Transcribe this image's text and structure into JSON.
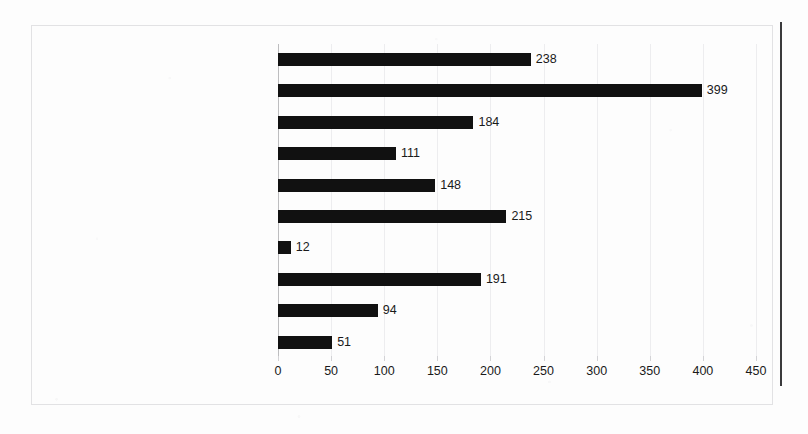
{
  "chart_data": {
    "type": "bar",
    "orientation": "horizontal",
    "title": "",
    "subtitle": "",
    "xlabel": "",
    "ylabel": "",
    "xlim": [
      0,
      450
    ],
    "xticks": [
      0,
      50,
      100,
      150,
      200,
      250,
      300,
      350,
      400,
      450
    ],
    "grid": true,
    "legend": false,
    "bar_color": "#111111",
    "gridline_color": "#ededef",
    "axis_color": "#bdbdbf",
    "categories": [
      "Settled science",
      "Political or ideological contest",
      "Policy or technical",
      "Opportunity",
      "Morality or ethics",
      "Economic",
      "Domestication or communitarianism",
      "Disaster",
      "Contested science",
      "Agriculture"
    ],
    "values": [
      238,
      399,
      184,
      111,
      148,
      215,
      12,
      191,
      94,
      51
    ],
    "data_labels": [
      "238",
      "399",
      "184",
      "111",
      "148",
      "215",
      "12",
      "191",
      "94",
      "51"
    ],
    "tick_labels": [
      "0",
      "50",
      "100",
      "150",
      "200",
      "250",
      "300",
      "350",
      "400",
      "450"
    ]
  }
}
